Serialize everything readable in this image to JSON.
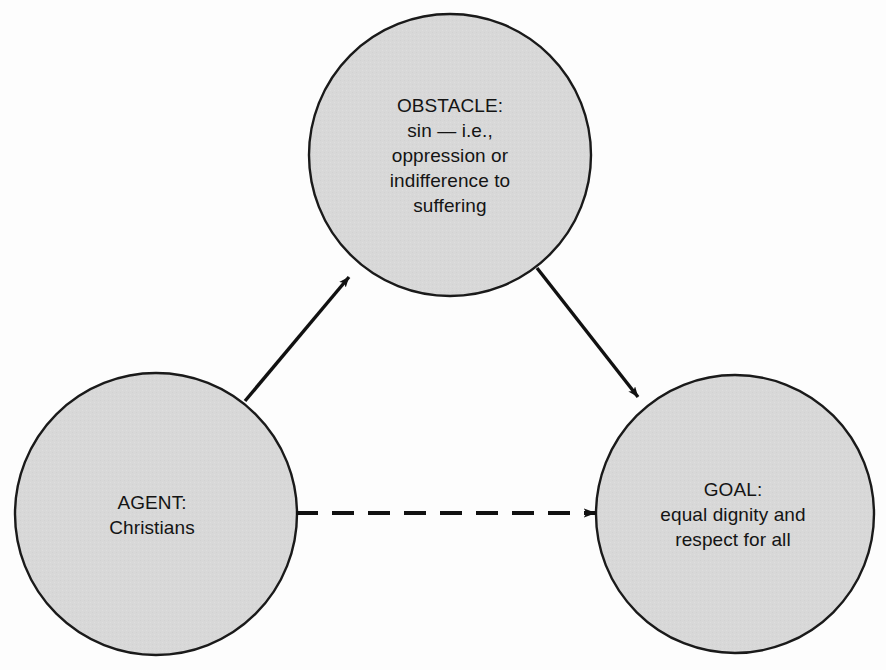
{
  "diagram": {
    "type": "triangle-flow-diagram",
    "background_color": "#fdfdfd",
    "node_fill_color": "#d8d8d8",
    "node_stroke_color": "#1a1a1a",
    "connector_color": "#111111",
    "nodes": [
      {
        "id": "obstacle",
        "name": "obstacle-node",
        "heading": "OBSTACLE:",
        "body": "sin — i.e.,\noppression or\nindifference to\nsuffering",
        "text": "OBSTACLE:\nsin — i.e.,\noppression or\nindifference to\nsuffering",
        "cx": 450,
        "cy": 155,
        "r": 141,
        "label_x": 450,
        "label_y": 155
      },
      {
        "id": "agent",
        "name": "agent-node",
        "heading": "AGENT:",
        "body": "Christians",
        "text": "AGENT:\nChristians",
        "cx": 156,
        "cy": 514,
        "r": 141,
        "label_x": 152,
        "label_y": 515
      },
      {
        "id": "goal",
        "name": "goal-node",
        "heading": "GOAL:",
        "body": "equal dignity and\nrespect for all",
        "text": "GOAL:\nequal dignity and\nrespect for all",
        "cx": 735,
        "cy": 514,
        "r": 139,
        "label_x": 733,
        "label_y": 514
      }
    ],
    "connectors": [
      {
        "id": "agent-to-obstacle",
        "name": "arrow-agent-to-obstacle",
        "style": "solid",
        "from": "agent",
        "to": "obstacle",
        "x1": 245,
        "y1": 401,
        "x2": 349,
        "y2": 277
      },
      {
        "id": "obstacle-to-goal",
        "name": "arrow-obstacle-to-goal",
        "style": "solid",
        "from": "obstacle",
        "to": "goal",
        "x1": 537,
        "y1": 268,
        "x2": 638,
        "y2": 397
      },
      {
        "id": "agent-to-goal",
        "name": "arrow-agent-to-goal-dashed",
        "style": "dashed",
        "from": "agent",
        "to": "goal",
        "x1": 296,
        "y1": 513,
        "x2": 596,
        "y2": 513,
        "dash_length": 22,
        "dash_gap": 14
      }
    ]
  }
}
